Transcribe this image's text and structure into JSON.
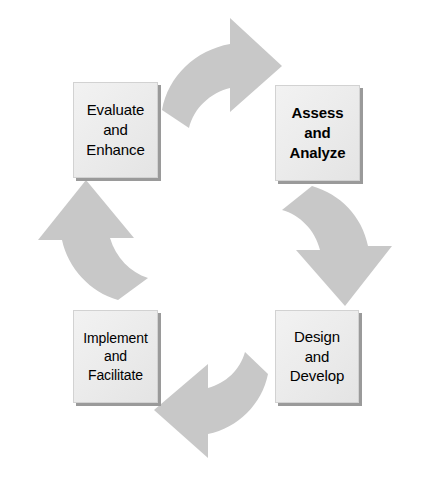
{
  "diagram": {
    "type": "cycle",
    "direction": "clockwise",
    "background_color": "#ffffff",
    "box_fill_color": "#ececec",
    "box_border_color": "#d2d2d2",
    "box_shadow_color": "#9a9a9a",
    "arrow_color": "#c8c8c8",
    "text_color": "#000000",
    "nodes": [
      {
        "id": "evaluate",
        "position": "top-left",
        "emphasis": false,
        "lines": [
          "Evaluate",
          "and",
          "Enhance"
        ]
      },
      {
        "id": "assess",
        "position": "top-right",
        "emphasis": true,
        "lines": [
          "Assess",
          "and",
          "Analyze"
        ]
      },
      {
        "id": "design",
        "position": "bottom-right",
        "emphasis": false,
        "lines": [
          "Design",
          "and",
          "Develop"
        ]
      },
      {
        "id": "implement",
        "position": "bottom-left",
        "emphasis": false,
        "lines": [
          "Implement",
          "and",
          "Facilitate"
        ]
      }
    ],
    "arrows": [
      {
        "id": "arrow-top",
        "from": "evaluate",
        "to": "assess",
        "points": "right",
        "icon": "curved-block-arrow-right-icon"
      },
      {
        "id": "arrow-right",
        "from": "assess",
        "to": "design",
        "points": "down",
        "icon": "curved-block-arrow-down-icon"
      },
      {
        "id": "arrow-bottom",
        "from": "design",
        "to": "implement",
        "points": "left",
        "icon": "curved-block-arrow-left-icon"
      },
      {
        "id": "arrow-left",
        "from": "implement",
        "to": "evaluate",
        "points": "up",
        "icon": "curved-block-arrow-up-icon"
      }
    ]
  }
}
